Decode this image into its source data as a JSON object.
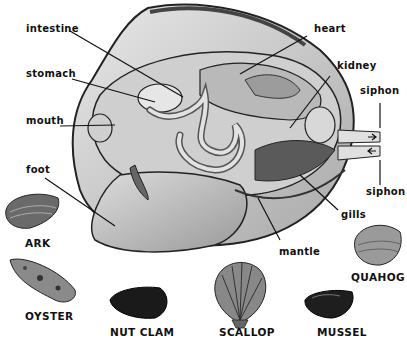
{
  "diagram": {
    "labels": {
      "intestine": "intestine",
      "stomach": "stomach",
      "mouth": "mouth",
      "foot": "foot",
      "heart": "heart",
      "kidney": "kidney",
      "siphon_top": "siphon",
      "siphon_bottom": "siphon",
      "gills": "gills",
      "mantle": "mantle"
    },
    "shells": [
      {
        "name": "ARK"
      },
      {
        "name": "OYSTER"
      },
      {
        "name": "NUT CLAM"
      },
      {
        "name": "SCALLOP"
      },
      {
        "name": "MUSSEL"
      },
      {
        "name": "QUAHOG"
      }
    ]
  }
}
